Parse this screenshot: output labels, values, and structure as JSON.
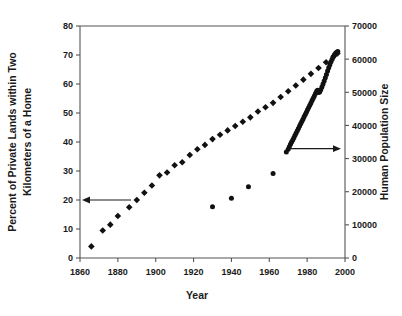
{
  "chart_data": {
    "type": "scatter",
    "title": "",
    "xlabel": "Year",
    "ylabel": "Percent of Private Lands within Two Kilometers of a Home",
    "ylabel_line1": "Percent of Private Lands within Two",
    "ylabel_line2": "Kilometers of a Home",
    "y2label": "Human Population Size",
    "xlim": [
      1860,
      2000
    ],
    "ylim": [
      0,
      80
    ],
    "y2lim": [
      0,
      70000
    ],
    "grid": false,
    "legend": false,
    "xticks": [
      1860,
      1880,
      1900,
      1920,
      1940,
      1960,
      1980,
      2000
    ],
    "xtick_labels": [
      "1860",
      "1880",
      "1900",
      "1920",
      "1940",
      "1960",
      "1980",
      "2000"
    ],
    "yticks": [
      0,
      10,
      20,
      30,
      40,
      50,
      60,
      70,
      80
    ],
    "ytick_labels": [
      "0",
      "10",
      "20",
      "30",
      "40",
      "50",
      "60",
      "70",
      "80"
    ],
    "y2ticks": [
      0,
      10000,
      20000,
      30000,
      40000,
      50000,
      60000,
      70000
    ],
    "y2tick_labels": [
      "0",
      "10000",
      "20000",
      "30000",
      "40000",
      "50000",
      "60000",
      "70000"
    ],
    "annotations": [
      {
        "name": "left-axis-arrow",
        "text": "",
        "x": 1868,
        "y": 20,
        "direction": "left"
      },
      {
        "name": "right-axis-arrow",
        "text": "",
        "x": 1972,
        "y": 33000,
        "direction": "right"
      }
    ],
    "series": [
      {
        "name": "Percent of Private Lands within Two Kilometers of a Home",
        "axis": "left",
        "marker": "diamond",
        "color": "#111111",
        "points": [
          [
            1866,
            4.0
          ],
          [
            1872,
            9.5
          ],
          [
            1876,
            11.5
          ],
          [
            1880,
            14.5
          ],
          [
            1886,
            17.5
          ],
          [
            1890,
            20.0
          ],
          [
            1894,
            22.5
          ],
          [
            1898,
            25.0
          ],
          [
            1902,
            28.5
          ],
          [
            1906,
            29.5
          ],
          [
            1910,
            32.0
          ],
          [
            1914,
            33.0
          ],
          [
            1918,
            35.5
          ],
          [
            1922,
            37.5
          ],
          [
            1926,
            39.0
          ],
          [
            1930,
            41.0
          ],
          [
            1934,
            42.5
          ],
          [
            1938,
            44.0
          ],
          [
            1942,
            45.5
          ],
          [
            1946,
            47.0
          ],
          [
            1950,
            48.5
          ],
          [
            1954,
            50.5
          ],
          [
            1958,
            52.0
          ],
          [
            1962,
            53.5
          ],
          [
            1966,
            55.5
          ],
          [
            1970,
            57.5
          ],
          [
            1974,
            59.5
          ],
          [
            1978,
            61.5
          ],
          [
            1982,
            63.5
          ],
          [
            1986,
            65.5
          ],
          [
            1990,
            67.5
          ],
          [
            1994,
            69.5
          ],
          [
            1996,
            70.5
          ]
        ]
      },
      {
        "name": "Human Population Size",
        "axis": "right",
        "marker": "circle",
        "color": "#111111",
        "points": [
          [
            1969,
            32000
          ],
          [
            1970,
            32800
          ],
          [
            1970.6,
            33600
          ],
          [
            1971.2,
            34300
          ],
          [
            1971.8,
            35000
          ],
          [
            1972.4,
            35600
          ],
          [
            1973,
            36300
          ],
          [
            1973.6,
            37000
          ],
          [
            1974.2,
            37700
          ],
          [
            1974.8,
            38400
          ],
          [
            1975.4,
            39100
          ],
          [
            1976,
            39800
          ],
          [
            1976.6,
            40500
          ],
          [
            1977.2,
            41200
          ],
          [
            1977.8,
            41900
          ],
          [
            1978.4,
            42600
          ],
          [
            1979,
            43300
          ],
          [
            1979.6,
            44000
          ],
          [
            1980.2,
            44700
          ],
          [
            1980.8,
            45400
          ],
          [
            1981.4,
            46100
          ],
          [
            1982,
            46800
          ],
          [
            1982.6,
            47500
          ],
          [
            1983.2,
            48200
          ],
          [
            1983.8,
            48900
          ],
          [
            1984.4,
            49600
          ],
          [
            1985,
            50300
          ],
          [
            1985.5,
            50600
          ],
          [
            1986,
            49900
          ],
          [
            1986.6,
            50100
          ],
          [
            1987.2,
            50800
          ],
          [
            1987.8,
            51600
          ],
          [
            1988.4,
            52500
          ],
          [
            1989,
            53400
          ],
          [
            1989.6,
            54400
          ],
          [
            1990.2,
            55400
          ],
          [
            1990.8,
            56400
          ],
          [
            1991.4,
            57400
          ],
          [
            1992,
            58300
          ],
          [
            1992.6,
            59200
          ],
          [
            1993.2,
            60000
          ],
          [
            1993.8,
            60700
          ],
          [
            1994.4,
            61300
          ],
          [
            1995,
            61800
          ],
          [
            1995.6,
            62100
          ],
          [
            1996.2,
            62300
          ]
        ]
      },
      {
        "name": "Human Population Size (early records)",
        "axis": "right",
        "marker": "circle",
        "color": "#111111",
        "points": [
          [
            1930,
            15500
          ],
          [
            1940,
            18000
          ],
          [
            1949,
            21500
          ],
          [
            1962,
            25500
          ]
        ]
      }
    ]
  }
}
